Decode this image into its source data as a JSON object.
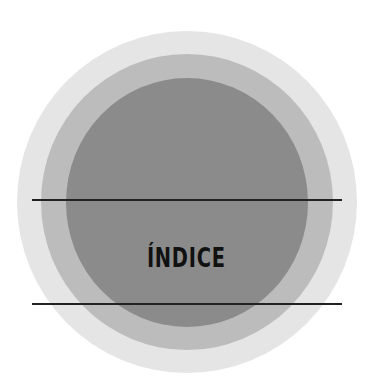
{
  "title": "ÍNDICE",
  "colors": {
    "background": "#ffffff",
    "outer_circle": "#e5e5e5",
    "middle_circle": "#bcbcbc",
    "inner_circle": "#8b8b8b",
    "lines": "#222222",
    "text": "#111111"
  }
}
